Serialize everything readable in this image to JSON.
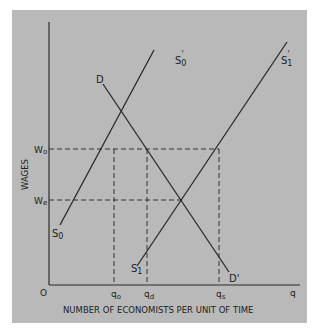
{
  "diagram": {
    "title": "",
    "axes": {
      "y_label": "WAGES",
      "x_label": "NUMBER OF ECONOMISTS PER UNIT OF TIME",
      "origin": "O",
      "x_end": "q"
    },
    "y_ticks": {
      "wo": {
        "main": "W",
        "sub": "o"
      },
      "we": {
        "main": "W",
        "sub": "e"
      }
    },
    "x_ticks": {
      "qo": {
        "main": "q",
        "sub": "o"
      },
      "qd": {
        "main": "q",
        "sub": "d"
      },
      "qs": {
        "main": "q",
        "sub": "s"
      }
    },
    "curves": {
      "d_start": "D",
      "d_end": "D'",
      "s0_start": {
        "main": "S",
        "sub": "0"
      },
      "s0_end": {
        "main": "S",
        "sub": "0",
        "prime": "'"
      },
      "s1_start": {
        "main": "S",
        "sub": "1"
      },
      "s1_end": {
        "main": "S",
        "sub": "1",
        "prime": "'"
      }
    },
    "colors": {
      "background": "#b9b9b9",
      "line": "#2a2a2a"
    }
  }
}
